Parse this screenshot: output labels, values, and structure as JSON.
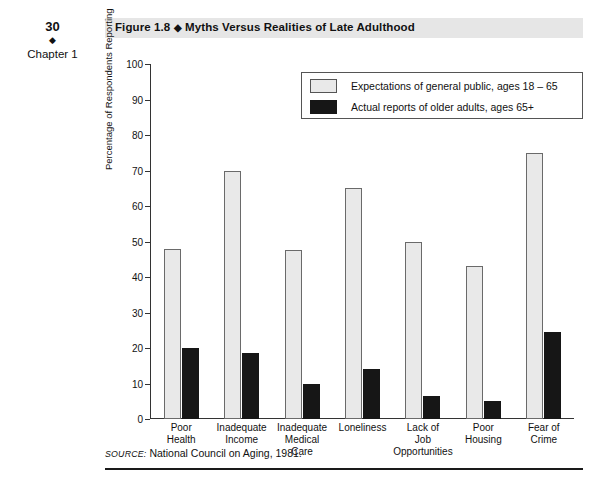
{
  "margin": {
    "page_number": "30",
    "diamond": "◆",
    "chapter_label": "Chapter 1"
  },
  "figure": {
    "number": "Figure 1.8",
    "diamond": "◆",
    "title": "Myths Versus Realities of Late Adulthood",
    "source_keyword": "SOURCE:",
    "source_text": "National Council on Aging, 1981."
  },
  "colors": {
    "title_bar_bg": "#e6e6e6",
    "series_light": "#e9e9e9",
    "series_light_border": "#6a6a6a",
    "series_dark": "#161616",
    "axis": "#333333",
    "rule": "#1a1a1a"
  },
  "chart_data": {
    "type": "bar",
    "title": "Myths Versus Realities of Late Adulthood",
    "xlabel": "",
    "ylabel": "Percentage of Respondents Reporting",
    "ylim": [
      0,
      100
    ],
    "yticks": [
      0,
      10,
      20,
      30,
      40,
      50,
      60,
      70,
      80,
      90,
      100
    ],
    "grid": false,
    "legend_position": "top-right-inside",
    "categories": [
      "Poor Health",
      "Inadequate Income",
      "Inadequate Medical Care",
      "Loneliness",
      "Lack of Job Opportunities",
      "Poor Housing",
      "Fear of Crime"
    ],
    "category_lines": [
      [
        "Poor",
        "Health"
      ],
      [
        "Inadequate",
        "Income"
      ],
      [
        "Inadequate",
        "Medical",
        "Care"
      ],
      [
        "Loneliness"
      ],
      [
        "Lack of",
        "Job",
        "Opportunities"
      ],
      [
        "Poor",
        "Housing"
      ],
      [
        "Fear of",
        "Crime"
      ]
    ],
    "series": [
      {
        "name": "Expectations of general public, ages 18 – 65",
        "color": "#e9e9e9",
        "values": [
          48,
          70,
          47.5,
          65,
          50,
          43,
          75
        ]
      },
      {
        "name": "Actual reports of older adults, ages 65+",
        "color": "#161616",
        "values": [
          20,
          18.5,
          10,
          14,
          6.5,
          5,
          24.5
        ]
      }
    ]
  }
}
